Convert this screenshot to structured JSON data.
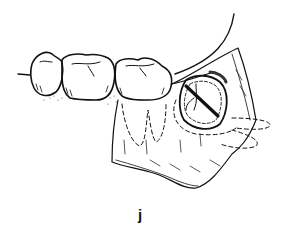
{
  "figure": {
    "panel_label": "j",
    "elements": [
      "teeth-row",
      "gingival-flap",
      "impacted-tooth",
      "incision-line",
      "dashed-root-outlines"
    ],
    "colors": {
      "stroke": "#111111",
      "background": "#ffffff"
    }
  }
}
